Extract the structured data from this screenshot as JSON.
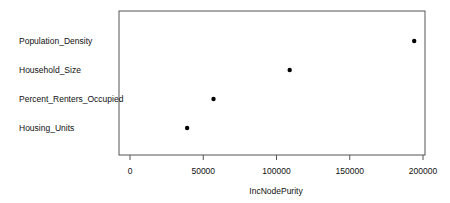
{
  "chart_data": {
    "type": "scatter",
    "subtype": "dotchart",
    "title": "",
    "xlabel": "IncNodePurity",
    "ylabel": "",
    "categories": [
      "Population_Density",
      "Household_Size",
      "Percent_Renters_Occupied",
      "Housing_Units"
    ],
    "values": [
      194000,
      109000,
      57000,
      39000
    ],
    "xlim": [
      -7500,
      202000
    ],
    "xticks": [
      0,
      50000,
      100000,
      150000,
      200000
    ],
    "xtick_labels": [
      "0",
      "50000",
      "100000",
      "150000",
      "200000"
    ],
    "grid": false,
    "legend": null,
    "marker_color": "#000000"
  }
}
